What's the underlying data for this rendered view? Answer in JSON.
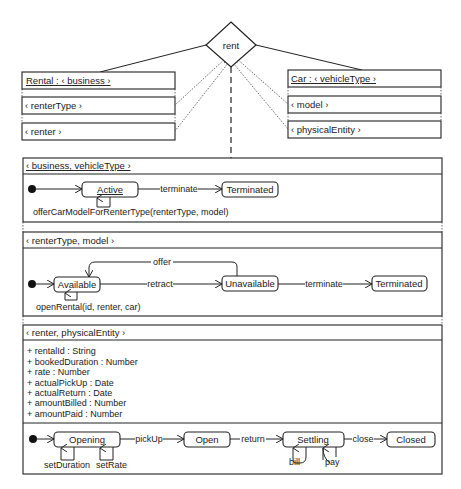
{
  "association": {
    "name": "rent"
  },
  "rental_class": {
    "header": "Rental : ‹ business ›",
    "rows": [
      "‹ renterType ›",
      "‹ renter ›"
    ]
  },
  "car_class": {
    "header": "Car : ‹ vehicleType ›",
    "rows": [
      "‹ model ›",
      "‹ physicalEntity ›"
    ]
  },
  "sections": [
    {
      "header": "‹ business, vehicleType ›",
      "states": [
        "Active",
        "Terminated"
      ],
      "transitions": [
        "terminate"
      ],
      "self_transition": "offerCarModelForRenterType(renterType, model)"
    },
    {
      "header": "‹ renterType, model ›",
      "states": [
        "Available",
        "Unavailable",
        "Terminated"
      ],
      "transitions": [
        "offer",
        "retract",
        "terminate"
      ],
      "self_transition": "openRental(id, renter, car)"
    },
    {
      "header": "‹ renter, physicalEntity ›",
      "attributes": [
        "+ rentalId : String",
        "+ bookedDuration : Number",
        "+ rate : Number",
        "+ actualPickUp : Date",
        "+ actualReturn : Date",
        "+ amountBilled : Number",
        "+ amountPaid : Number"
      ],
      "states": [
        "Opening",
        "Open",
        "Settling",
        "Closed"
      ],
      "transitions": [
        "pickUp",
        "return",
        "close"
      ],
      "self_transitions": [
        "setDuration",
        "setRate",
        "bill",
        "pay"
      ]
    }
  ],
  "colors": {
    "line": "#222222",
    "background": "#ffffff"
  }
}
